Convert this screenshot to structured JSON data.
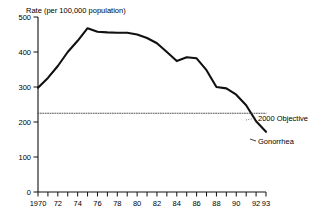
{
  "chart_data": {
    "type": "line",
    "title": "Rate (per 100,000 population)",
    "xlabel": "",
    "ylabel": "Rate (per 100,000 population)",
    "xlim": [
      1970,
      1993
    ],
    "ylim": [
      0,
      500
    ],
    "grid": false,
    "legend_position": "inline-right",
    "y_ticks": [
      0,
      100,
      200,
      300,
      400,
      500
    ],
    "y_tick_labels": [
      "0",
      "100",
      "200",
      "300",
      "400",
      "500"
    ],
    "x_ticks": [
      1970,
      1971,
      1972,
      1973,
      1974,
      1975,
      1976,
      1977,
      1978,
      1979,
      1980,
      1981,
      1982,
      1983,
      1984,
      1985,
      1986,
      1987,
      1988,
      1989,
      1990,
      1991,
      1992,
      1993
    ],
    "x_tick_labels": [
      "1970",
      "",
      "72",
      "",
      "74",
      "",
      "76",
      "",
      "78",
      "",
      "80",
      "",
      "82",
      "",
      "84",
      "",
      "86",
      "",
      "88",
      "",
      "90",
      "",
      "92",
      "93"
    ],
    "series": [
      {
        "name": "Gonorrhea",
        "style": "solid",
        "color": "#111111",
        "x": [
          1970,
          1971,
          1972,
          1973,
          1974,
          1975,
          1976,
          1977,
          1978,
          1979,
          1980,
          1981,
          1982,
          1983,
          1984,
          1985,
          1986,
          1987,
          1988,
          1989,
          1990,
          1991,
          1992,
          1993
        ],
        "values": [
          298,
          326,
          360,
          400,
          432,
          468,
          458,
          456,
          455,
          455,
          450,
          440,
          425,
          400,
          374,
          385,
          382,
          348,
          300,
          296,
          278,
          248,
          202,
          172
        ]
      },
      {
        "name": "2000 Objective",
        "style": "dotted",
        "color": "#444444",
        "x": [
          1970,
          1993
        ],
        "values": [
          225,
          225
        ]
      }
    ],
    "annotations": [
      {
        "name": "2000 Objective",
        "label": "2000 Objective",
        "value": 225
      },
      {
        "name": "Gonorrhea",
        "label": "Gonorrhea",
        "value": 172
      }
    ]
  }
}
